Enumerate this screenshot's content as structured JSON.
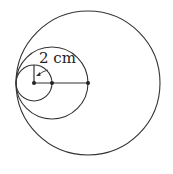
{
  "diagram": {
    "type": "nested-tangent-circles",
    "label": "2 cm",
    "colors": {
      "stroke": "#333333",
      "background": "#ffffff"
    },
    "circles": [
      {
        "name": "small",
        "cx": 34,
        "cy": 83,
        "r": 18
      },
      {
        "name": "medium",
        "cx": 52,
        "cy": 83,
        "r": 36
      },
      {
        "name": "large",
        "cx": 88,
        "cy": 83,
        "r": 72
      }
    ],
    "points": [
      {
        "name": "small-center",
        "x": 34,
        "y": 83
      },
      {
        "name": "medium-center",
        "x": 52,
        "y": 83
      },
      {
        "name": "large-center",
        "x": 88,
        "y": 83
      }
    ]
  }
}
